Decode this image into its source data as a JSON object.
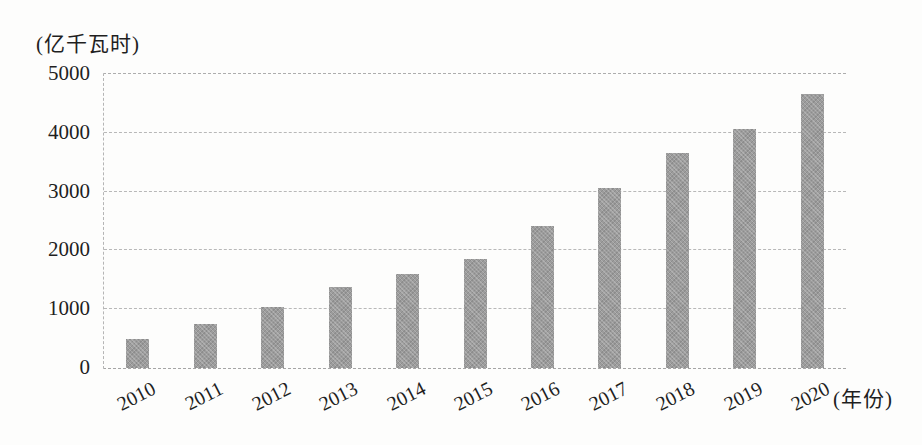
{
  "chart_data": {
    "type": "bar",
    "title": "",
    "unit_label": "(亿千瓦时)",
    "xaxis_suffix_label": "(年份)",
    "categories": [
      "2010",
      "2011",
      "2012",
      "2013",
      "2014",
      "2015",
      "2016",
      "2017",
      "2018",
      "2019",
      "2020"
    ],
    "values": [
      494,
      741,
      1030,
      1383,
      1598,
      1856,
      2410,
      3057,
      3660,
      4057,
      4665
    ],
    "xlabel": "年份",
    "ylabel": "亿千瓦时",
    "ylim": [
      0,
      5000
    ],
    "yticks": [
      0,
      1000,
      2000,
      3000,
      4000,
      5000
    ],
    "legend": "none",
    "grid": "horizontal-dashed",
    "colors": {
      "bar": "#9c9c9c",
      "gridline": "#b8b8b8",
      "text": "#1f1f1f",
      "background": "#fdfdfc"
    }
  }
}
